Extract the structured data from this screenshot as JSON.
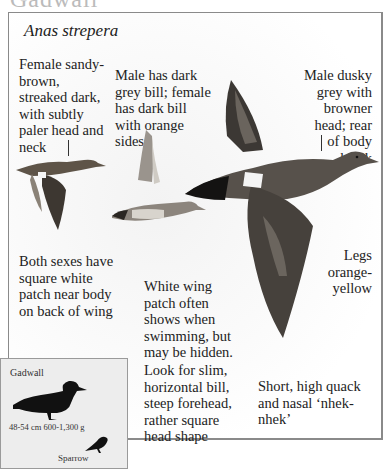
{
  "page": {
    "title": "Gadwall"
  },
  "species": {
    "latin_name": "Anas strepera"
  },
  "notes": {
    "female_plumage": "Female sandy-brown, streaked dark, with subtly paler head and neck",
    "bills": "Male has dark grey bill; female has dark bill with orange sides",
    "male_plumage": "Male dusky grey with browner head; rear of body black",
    "wing_patch": "Both sexes have square white patch near body on back of wing",
    "swimming": "White wing patch often shows when swimming, but may be hidden.",
    "legs": "Legs orange-yellow",
    "head_shape": "Look for slim, horizontal bill, steep forehead, rather square head shape",
    "voice": "Short, high quack and nasal ‘nhek-nhek’"
  },
  "size_comparison": {
    "bird_name": "Gadwall",
    "size": "48-54 cm  600-1,300 g",
    "reference_bird": "Sparrow"
  },
  "illustrations": [
    {
      "name": "female-in-flight"
    },
    {
      "name": "male-swimming"
    },
    {
      "name": "male-in-flight"
    }
  ],
  "colors": {
    "frame_border": "#8a8a8a",
    "silhouette_box_bg": "#ededed",
    "silhouette": "#111111",
    "text": "#222222"
  }
}
